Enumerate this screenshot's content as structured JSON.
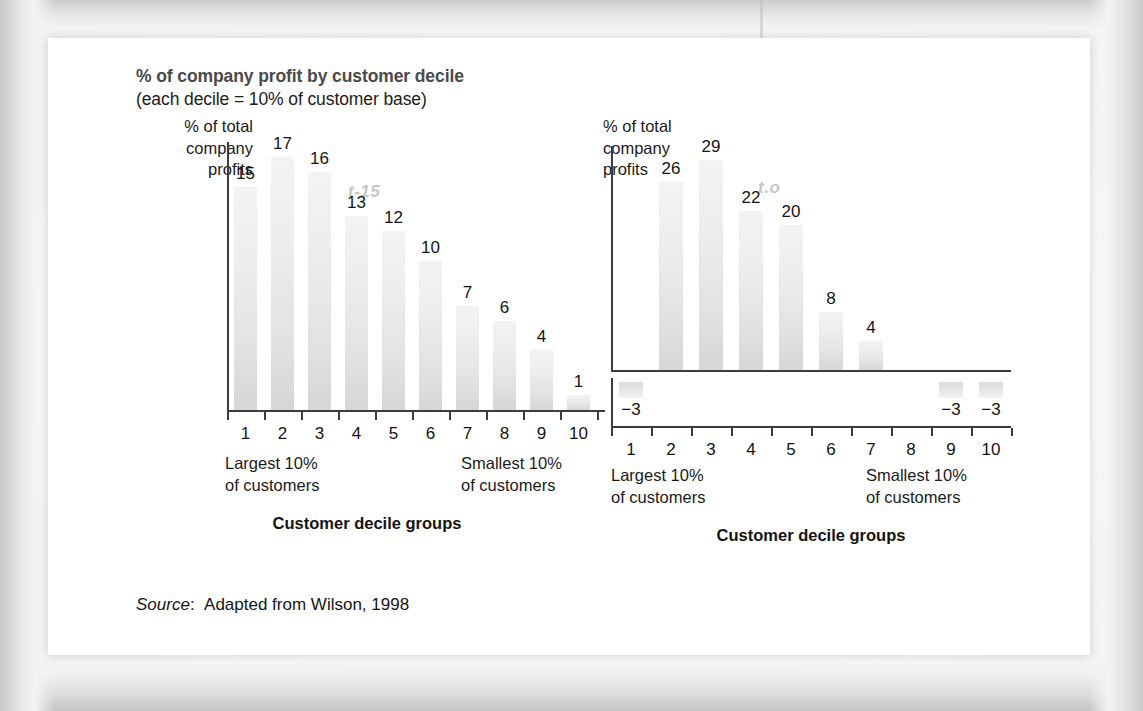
{
  "figure": {
    "heading_line_1": "% of company profit by customer decile",
    "heading_line_2": "(each decile = 10% of customer base)",
    "source_label": "Source",
    "source_separator": ":",
    "source_text": "Adapted from Wilson, 1998",
    "page_background": "#ffffff",
    "bar_fill_top": "#f3f3f3",
    "bar_fill_bottom": "#d6d6d6",
    "axis_color": "#3c3c3c",
    "watermark_color": "#c6c6c6"
  },
  "charts": [
    {
      "id": "chart-left",
      "watermark": "t-15",
      "y_axis_title_line_1": "% of total",
      "y_axis_title_line_2": "company",
      "y_axis_title_line_3": "profits",
      "left_caption_line_1": "Largest 10%",
      "left_caption_line_2": "of customers",
      "right_caption_line_1": "Smallest 10%",
      "right_caption_line_2": "of customers",
      "axis_title": "Customer decile groups"
    },
    {
      "id": "chart-right",
      "watermark": "t.o",
      "y_axis_title_line_1": "% of total",
      "y_axis_title_line_2": "company",
      "y_axis_title_line_3": "profits",
      "left_caption_line_1": "Largest 10%",
      "left_caption_line_2": "of customers",
      "right_caption_line_1": "Smallest 10%",
      "right_caption_line_2": "of customers",
      "axis_title": "Customer decile groups"
    }
  ],
  "chart_data": [
    {
      "type": "bar",
      "title": "% of company profit by customer decile (each decile = 10% of customer base)",
      "subtitle": "t-15",
      "xlabel": "Customer decile groups",
      "ylabel": "% of total company profits",
      "categories": [
        "1",
        "2",
        "3",
        "4",
        "5",
        "6",
        "7",
        "8",
        "9",
        "10"
      ],
      "values": [
        15,
        17,
        16,
        13,
        12,
        10,
        7,
        6,
        4,
        1
      ],
      "value_labels": [
        "15",
        "17",
        "16",
        "13",
        "12",
        "10",
        "7",
        "6",
        "4",
        "1"
      ],
      "ylim": [
        0,
        18
      ],
      "grid": false,
      "legend": "none",
      "annotations": [
        "Largest 10% of customers",
        "Smallest 10% of customers"
      ]
    },
    {
      "type": "bar",
      "title": "% of company profit by customer decile (each decile = 10% of customer base)",
      "subtitle": "t.o",
      "xlabel": "Customer decile groups",
      "ylabel": "% of total company profits",
      "categories": [
        "1",
        "2",
        "3",
        "4",
        "5",
        "6",
        "7",
        "8",
        "9",
        "10"
      ],
      "values": [
        -3,
        26,
        29,
        22,
        20,
        8,
        4,
        0,
        -3,
        -3
      ],
      "value_labels": [
        "−3",
        "26",
        "29",
        "22",
        "20",
        "8",
        "4",
        "",
        "−3",
        "−3"
      ],
      "ylim": [
        -5,
        31
      ],
      "grid": false,
      "legend": "none",
      "annotations": [
        "Largest 10% of customers",
        "Smallest 10% of customers"
      ]
    }
  ]
}
